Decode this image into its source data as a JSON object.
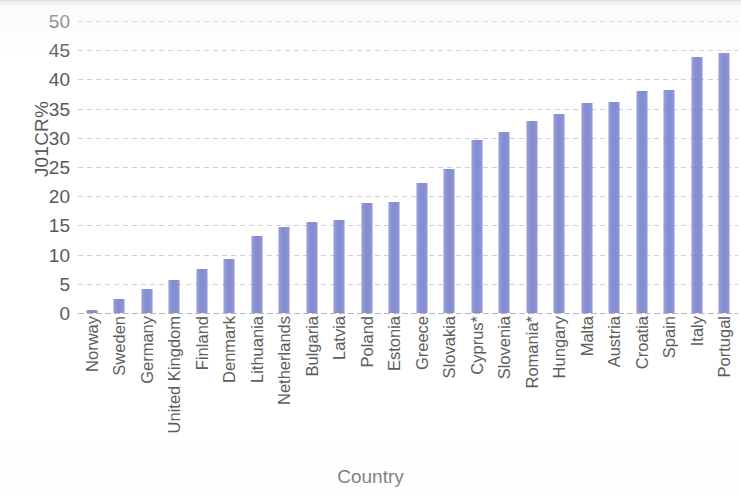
{
  "chart_data": {
    "type": "bar",
    "title": "",
    "xlabel": "Country",
    "ylabel": "J01CR%",
    "ylim": [
      0,
      50
    ],
    "ytick_step": 5,
    "yticks": [
      50,
      45,
      40,
      35,
      30,
      25,
      20,
      15,
      10,
      5,
      0
    ],
    "grid": true,
    "legend": "none",
    "bar_color": "#7d86cf",
    "axis_text_color": "#5a5a5a",
    "gridline_color": "#c8c8ce",
    "categories": [
      "Norway",
      "Sweden",
      "Germany",
      "United Kingdom",
      "Finland",
      "Denmark",
      "Lithuania",
      "Netherlands",
      "Bulgaria",
      "Latvia",
      "Poland",
      "Estonia",
      "Greece",
      "Slovakia",
      "Cyprus*",
      "Slovenia",
      "Romania*",
      "Hungary",
      "Malta",
      "Austria",
      "Croatia",
      "Spain",
      "Italy",
      "Portugal"
    ],
    "values": [
      0.5,
      2.4,
      4.1,
      5.6,
      7.5,
      9.2,
      13.2,
      14.7,
      15.5,
      16.0,
      18.8,
      19.0,
      22.3,
      24.6,
      29.7,
      31.0,
      32.8,
      34.1,
      36.0,
      36.2,
      38.0,
      38.2,
      43.8,
      44.5
    ]
  }
}
